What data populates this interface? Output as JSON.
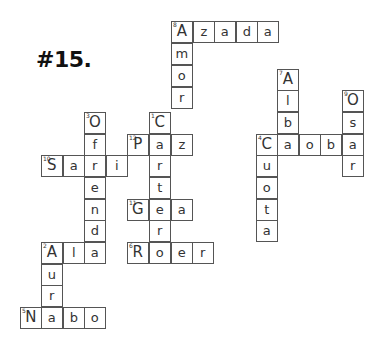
{
  "title": "#15.",
  "cell_size": 21.6,
  "cells": [
    {
      "x": 171,
      "y": 21,
      "ch": "A",
      "num": "8"
    },
    {
      "x": 193,
      "y": 21,
      "ch": "z"
    },
    {
      "x": 214,
      "y": 21,
      "ch": "a"
    },
    {
      "x": 236,
      "y": 21,
      "ch": "d"
    },
    {
      "x": 257,
      "y": 21,
      "ch": "a"
    },
    {
      "x": 171,
      "y": 43,
      "ch": "m"
    },
    {
      "x": 171,
      "y": 65,
      "ch": "o"
    },
    {
      "x": 171,
      "y": 87,
      "ch": "r"
    },
    {
      "x": 149,
      "y": 112,
      "ch": "C",
      "num": "1"
    },
    {
      "x": 127,
      "y": 134,
      "ch": "P",
      "num": "12"
    },
    {
      "x": 149,
      "y": 134,
      "ch": "a"
    },
    {
      "x": 171,
      "y": 134,
      "ch": "z"
    },
    {
      "x": 149,
      "y": 155,
      "ch": "r"
    },
    {
      "x": 149,
      "y": 177,
      "ch": "t"
    },
    {
      "x": 127,
      "y": 199,
      "ch": "G",
      "num": "11"
    },
    {
      "x": 149,
      "y": 199,
      "ch": "e"
    },
    {
      "x": 171,
      "y": 199,
      "ch": "a"
    },
    {
      "x": 149,
      "y": 220,
      "ch": "r"
    },
    {
      "x": 127,
      "y": 242,
      "ch": "R",
      "num": "6"
    },
    {
      "x": 149,
      "y": 242,
      "ch": "o"
    },
    {
      "x": 171,
      "y": 242,
      "ch": "e"
    },
    {
      "x": 192,
      "y": 242,
      "ch": "r"
    },
    {
      "x": 84,
      "y": 112,
      "ch": "O",
      "num": "3"
    },
    {
      "x": 84,
      "y": 134,
      "ch": "f"
    },
    {
      "x": 41,
      "y": 155,
      "ch": "S",
      "num": "10"
    },
    {
      "x": 63,
      "y": 155,
      "ch": "a"
    },
    {
      "x": 84,
      "y": 155,
      "ch": "r"
    },
    {
      "x": 106,
      "y": 155,
      "ch": "i"
    },
    {
      "x": 84,
      "y": 177,
      "ch": "e"
    },
    {
      "x": 84,
      "y": 199,
      "ch": "n"
    },
    {
      "x": 84,
      "y": 220,
      "ch": "d"
    },
    {
      "x": 41,
      "y": 242,
      "ch": "A",
      "num": "2"
    },
    {
      "x": 63,
      "y": 242,
      "ch": "l"
    },
    {
      "x": 84,
      "y": 242,
      "ch": "a"
    },
    {
      "x": 41,
      "y": 264,
      "ch": "u"
    },
    {
      "x": 41,
      "y": 285,
      "ch": "r"
    },
    {
      "x": 20,
      "y": 307,
      "ch": "N",
      "num": "5"
    },
    {
      "x": 41,
      "y": 307,
      "ch": "a"
    },
    {
      "x": 63,
      "y": 307,
      "ch": "b"
    },
    {
      "x": 84,
      "y": 307,
      "ch": "o"
    },
    {
      "x": 277,
      "y": 69,
      "ch": "A",
      "num": "7"
    },
    {
      "x": 277,
      "y": 90,
      "ch": "l"
    },
    {
      "x": 277,
      "y": 112,
      "ch": "b"
    },
    {
      "x": 256,
      "y": 134,
      "ch": "C",
      "num": "4"
    },
    {
      "x": 277,
      "y": 134,
      "ch": "a"
    },
    {
      "x": 299,
      "y": 134,
      "ch": "o"
    },
    {
      "x": 320,
      "y": 134,
      "ch": "b"
    },
    {
      "x": 342,
      "y": 134,
      "ch": "a"
    },
    {
      "x": 342,
      "y": 90,
      "ch": "O",
      "num": "9"
    },
    {
      "x": 342,
      "y": 112,
      "ch": "s"
    },
    {
      "x": 342,
      "y": 155,
      "ch": "r"
    },
    {
      "x": 256,
      "y": 155,
      "ch": "u"
    },
    {
      "x": 256,
      "y": 177,
      "ch": "o"
    },
    {
      "x": 256,
      "y": 199,
      "ch": "t"
    },
    {
      "x": 256,
      "y": 220,
      "ch": "a"
    }
  ]
}
